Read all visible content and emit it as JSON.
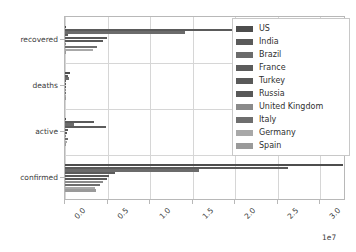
{
  "chart_data": {
    "type": "bar",
    "orientation": "horizontal",
    "title": "",
    "xlabel": "",
    "ylabel": "",
    "categories": [
      "confirmed",
      "active",
      "deaths",
      "recovered"
    ],
    "category_order_top_to_bottom": [
      "recovered",
      "deaths",
      "active",
      "confirmed"
    ],
    "xlim": [
      0,
      33000000
    ],
    "xticks": [
      0,
      5000000,
      10000000,
      15000000,
      20000000,
      25000000,
      30000000
    ],
    "xtick_labels": [
      "0.0",
      "0.5",
      "1.0",
      "1.5",
      "2.0",
      "2.5",
      "3.0"
    ],
    "x_offset_label": "1e7",
    "grid": true,
    "legend_position": "upper right",
    "series": [
      {
        "name": "US",
        "color": "#4d4d4d",
        "values": {
          "confirmed": 32700000,
          "active": 0,
          "deaths": 582000,
          "recovered": 0
        }
      },
      {
        "name": "India",
        "color": "#5a5a5a",
        "values": {
          "confirmed": 26200000,
          "active": 3400000,
          "deaths": 295000,
          "recovered": 22500000
        }
      },
      {
        "name": "Brazil",
        "color": "#6b6b6b",
        "values": {
          "confirmed": 15700000,
          "active": 1100000,
          "deaths": 438000,
          "recovered": 14100000
        }
      },
      {
        "name": "France",
        "color": "#5c5c5c",
        "values": {
          "confirmed": 5900000,
          "active": 4800000,
          "deaths": 107000,
          "recovered": 310000
        }
      },
      {
        "name": "Turkey",
        "color": "#595959",
        "values": {
          "confirmed": 5150000,
          "active": 330000,
          "deaths": 45000,
          "recovered": 4960000
        }
      },
      {
        "name": "Russia",
        "color": "#585858",
        "values": {
          "confirmed": 4900000,
          "active": 270000,
          "deaths": 113000,
          "recovered": 4520000
        }
      },
      {
        "name": "United Kingdom",
        "color": "#8a8a8a",
        "values": {
          "confirmed": 4450000,
          "active": 0,
          "deaths": 128000,
          "recovered": 0
        }
      },
      {
        "name": "Italy",
        "color": "#6e6e6e",
        "values": {
          "confirmed": 4160000,
          "active": 330000,
          "deaths": 124000,
          "recovered": 3700000
        }
      },
      {
        "name": "Germany",
        "color": "#a8a8a8",
        "values": {
          "confirmed": 3580000,
          "active": 250000,
          "deaths": 86000,
          "recovered": 3240000
        }
      },
      {
        "name": "Spain",
        "color": "#9a9a9a",
        "values": {
          "confirmed": 3590000,
          "active": 0,
          "deaths": 79000,
          "recovered": 0
        }
      }
    ]
  }
}
